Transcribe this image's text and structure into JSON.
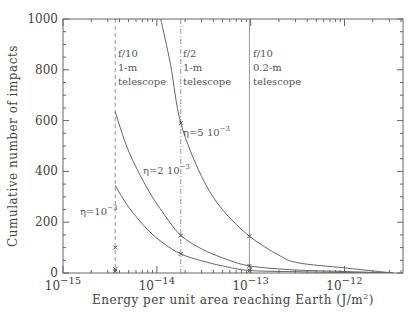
{
  "chart_data": {
    "type": "line",
    "title": "",
    "xlabel": "Energy per unit area reaching Earth (J/m²)",
    "ylabel": "Cumulative number of impacts",
    "xscale": "log",
    "xlim": [
      1e-15,
      4.2e-12
    ],
    "ylim": [
      0,
      1000
    ],
    "x_ticks": [
      {
        "value": 1e-15,
        "label_base": "10",
        "label_exp": "−15"
      },
      {
        "value": 1e-14,
        "label_base": "10",
        "label_exp": "−14"
      },
      {
        "value": 1e-13,
        "label_base": "10",
        "label_exp": "−13"
      },
      {
        "value": 1e-12,
        "label_base": "10",
        "label_exp": "−12"
      }
    ],
    "y_ticks": [
      0,
      200,
      400,
      600,
      800,
      1000
    ],
    "grid": false,
    "series": [
      {
        "name": "η=5 10⁻³",
        "eta": 0.005,
        "points": [
          [
            1.1e-14,
            1000
          ],
          [
            1.4e-14,
            820
          ],
          [
            1.8e-14,
            590
          ],
          [
            3e-14,
            380
          ],
          [
            5e-14,
            250
          ],
          [
            9.7e-14,
            145
          ],
          [
            2e-13,
            70
          ],
          [
            3.2e-13,
            40
          ],
          [
            1e-12,
            20
          ],
          [
            3.3e-12,
            0
          ]
        ]
      },
      {
        "name": "η=2 10⁻³",
        "eta": 0.002,
        "points": [
          [
            3.6e-15,
            635
          ],
          [
            5e-15,
            480
          ],
          [
            8e-15,
            330
          ],
          [
            1.2e-14,
            230
          ],
          [
            1.8e-14,
            148
          ],
          [
            3e-14,
            95
          ],
          [
            5e-14,
            60
          ],
          [
            9.7e-14,
            28
          ],
          [
            3e-13,
            12
          ],
          [
            1e-12,
            6
          ],
          [
            3.3e-12,
            0
          ]
        ]
      },
      {
        "name": "η=10⁻³",
        "eta": 0.001,
        "points": [
          [
            3.6e-15,
            345
          ],
          [
            5e-15,
            260
          ],
          [
            8e-15,
            170
          ],
          [
            1.2e-14,
            115
          ],
          [
            1.8e-14,
            75
          ],
          [
            3e-14,
            48
          ],
          [
            5e-14,
            28
          ],
          [
            9.7e-14,
            10
          ],
          [
            3e-13,
            5
          ],
          [
            1e-12,
            2
          ],
          [
            3.3e-12,
            0
          ]
        ]
      }
    ],
    "markers": [
      {
        "x": 3.6e-15,
        "y": 100
      },
      {
        "x": 3.6e-15,
        "y": 15
      },
      {
        "x": 3.6e-15,
        "y": 8
      },
      {
        "x": 1.8e-14,
        "y": 590
      },
      {
        "x": 1.8e-14,
        "y": 148
      },
      {
        "x": 1.8e-14,
        "y": 75
      },
      {
        "x": 9.7e-14,
        "y": 145
      },
      {
        "x": 9.7e-14,
        "y": 28
      },
      {
        "x": 9.7e-14,
        "y": 10
      }
    ],
    "vertical_lines": [
      {
        "x": 3.6e-15,
        "style": "dashed",
        "label": [
          "f/10",
          "1-m",
          "telescope"
        ]
      },
      {
        "x": 1.8e-14,
        "style": "dash-dot",
        "label": [
          "f/2",
          "1-m",
          "telescope"
        ]
      },
      {
        "x": 9.7e-14,
        "style": "solid",
        "label": [
          "f/10",
          "0.2-m",
          "telescope"
        ]
      }
    ],
    "annotations": [
      {
        "text": "η=5 10⁻³",
        "near_series": 0
      },
      {
        "text": "η=2 10⁻³",
        "near_series": 1
      },
      {
        "text": "η=10⁻³",
        "near_series": 2
      }
    ]
  },
  "labels": {
    "xlabel": "Energy per unit area reaching Earth (J/m",
    "xlabel_sup": "2",
    "xlabel_end": ")",
    "ylabel": "Cumulative number of impacts",
    "eta5": "η=5  10",
    "eta5_exp": "−3",
    "eta2": "η=2  10",
    "eta2_exp": "−3",
    "eta1": "η=10",
    "eta1_exp": "−3",
    "tel1_l1": "f/10",
    "tel1_l2": "1-m",
    "tel1_l3": "telescope",
    "tel2_l1": "f/2",
    "tel2_l2": "1-m",
    "tel2_l3": "telescope",
    "tel3_l1": "f/10",
    "tel3_l2": "0.2-m",
    "tel3_l3": "telescope"
  },
  "colors": {
    "axis": "#666666",
    "curve": "#666666",
    "text": "#444444"
  }
}
